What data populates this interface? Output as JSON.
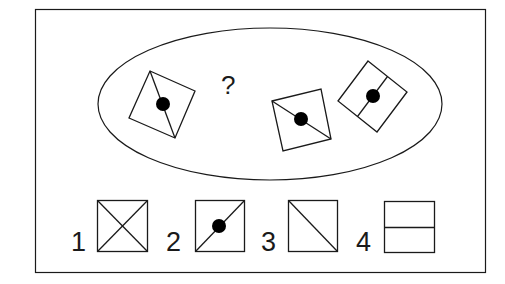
{
  "puzzle": {
    "question_mark": "?",
    "colors": {
      "stroke": "#1a1a1a",
      "dot": "#000000",
      "background": "#ffffff"
    },
    "sequence_shapes": [
      {
        "id": "A",
        "description": "rotated square with corner-to-corner diagonal and center dot"
      },
      {
        "id": "missing",
        "description": "question mark placeholder"
      },
      {
        "id": "B",
        "description": "rotated square with corner-to-corner diagonal and center dot"
      },
      {
        "id": "C",
        "description": "rotated square with midline and center dot"
      }
    ],
    "options": [
      {
        "label": "1",
        "description": "square with both diagonals (X)"
      },
      {
        "label": "2",
        "description": "square with one diagonal and center dot"
      },
      {
        "label": "3",
        "description": "square with one diagonal"
      },
      {
        "label": "4",
        "description": "square with horizontal midline"
      }
    ]
  }
}
